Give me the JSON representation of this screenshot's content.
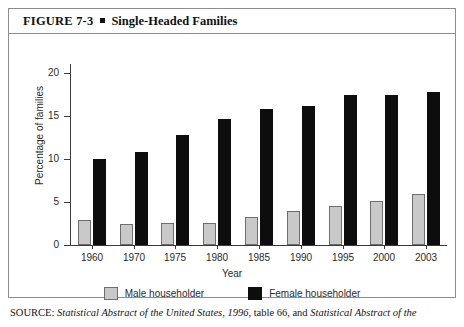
{
  "figure": {
    "number": "FIGURE 7-3",
    "title": "Single-Headed Families"
  },
  "source": {
    "label": "SOURCE:",
    "part1_italic": "Statistical Abstract of the United States, 1996",
    "part2": ", table 66, and ",
    "part3_italic": "Statistical Abstract of the"
  },
  "legend": {
    "male_label": "Male householder",
    "female_label": "Female householder",
    "male_color": "#c9c9c9",
    "female_color": "#0d0d0d"
  },
  "chart_data": {
    "type": "bar",
    "title": "Single-Headed Families",
    "xlabel": "Year",
    "ylabel": "Percentage of families",
    "ylim": [
      0,
      21
    ],
    "yticks": [
      0,
      5,
      10,
      15,
      20
    ],
    "ytick_labels": [
      "0",
      "5",
      "10",
      "15",
      "20"
    ],
    "grid": false,
    "legend_position": "bottom",
    "categories": [
      "1960",
      "1970",
      "1975",
      "1980",
      "1985",
      "1990",
      "1995",
      "2000",
      "2003"
    ],
    "series": [
      {
        "name": "Male householder",
        "color": "#c9c9c9",
        "values": [
          2.9,
          2.4,
          2.5,
          2.6,
          3.3,
          4.0,
          4.5,
          5.1,
          5.9
        ]
      },
      {
        "name": "Female householder",
        "color": "#0d0d0d",
        "values": [
          10.0,
          10.8,
          12.8,
          14.6,
          15.8,
          16.1,
          17.4,
          17.4,
          17.7
        ]
      }
    ]
  }
}
